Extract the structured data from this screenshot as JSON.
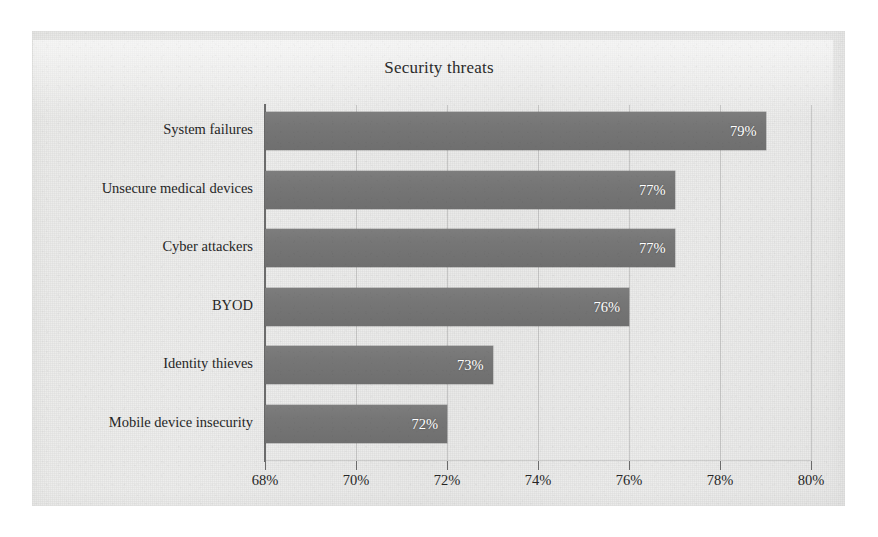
{
  "chart_data": {
    "type": "bar",
    "orientation": "horizontal",
    "title": "Security threats",
    "xlabel": "",
    "ylabel": "",
    "categories": [
      "System failures",
      "Unsecure medical devices",
      "Cyber attackers",
      "BYOD",
      "Identity thieves",
      "Mobile device insecurity"
    ],
    "values": [
      79,
      77,
      77,
      76,
      73,
      72
    ],
    "value_labels": [
      "79%",
      "77%",
      "77%",
      "76%",
      "73%",
      "72%"
    ],
    "xlim": [
      68,
      80
    ],
    "xtick_values": [
      68,
      70,
      72,
      74,
      76,
      78,
      80
    ],
    "xtick_labels": [
      "68%",
      "70%",
      "72%",
      "74%",
      "76%",
      "78%",
      "80%"
    ],
    "grid": "vertical",
    "legend": "none",
    "bar_color": "#767676",
    "value_label_color": "#ffffff",
    "background_color": "#e9e9e7",
    "axis_color": "#6c6c6c"
  }
}
